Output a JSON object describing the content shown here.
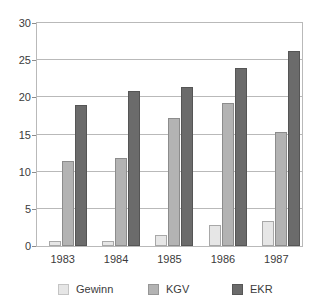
{
  "chart_data": {
    "type": "bar",
    "title": "",
    "subtitle": "",
    "xlabel": "",
    "ylabel": "",
    "categories": [
      "1983",
      "1984",
      "1985",
      "1986",
      "1987"
    ],
    "series": [
      {
        "name": "Gewinn",
        "color": "#e6e6e6",
        "values": [
          0.7,
          0.7,
          1.5,
          2.8,
          3.4
        ]
      },
      {
        "name": "KGV",
        "color": "#b3b3b3",
        "values": [
          11.5,
          11.8,
          17.2,
          19.3,
          15.3
        ]
      },
      {
        "name": "EKR",
        "color": "#6b6b6b",
        "values": [
          19.0,
          20.9,
          21.4,
          24.0,
          26.3
        ]
      }
    ],
    "ylim": [
      0,
      30
    ],
    "yticks": [
      0,
      5,
      10,
      15,
      20,
      25,
      30
    ],
    "ytick_labels": [
      "0",
      "5",
      "10",
      "15",
      "20",
      "25",
      "30"
    ],
    "grid": true,
    "grid_axis": "y",
    "legend_position": "bottom",
    "frame": true,
    "bar_group_count": 5,
    "bars_per_group": 3
  }
}
